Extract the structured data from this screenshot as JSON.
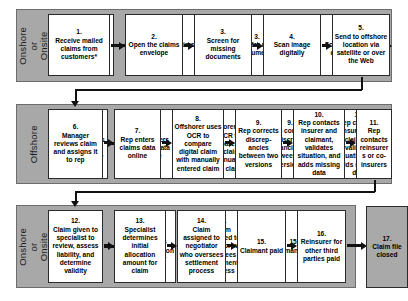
{
  "diagram": {
    "colors": {
      "band_fill": "#a8a8a8",
      "band_border": "#6d6d6d",
      "node_fill": "#ffffff",
      "node_border": "#2b2b2b",
      "node_shaded_fill": "#a9a9a9",
      "connector": "#111111",
      "page_background": "#ffffff"
    },
    "bands": [
      {
        "id": "band-onshore-top",
        "label": "Onshore\nor Onsite"
      },
      {
        "id": "band-offshore",
        "label": "Offshore"
      },
      {
        "id": "band-onshore-bottom",
        "label": "Onshore\nor Onsite"
      }
    ],
    "nodes": [
      {
        "num": "1.",
        "text": "Receive mailed claims from customers*"
      },
      {
        "num": "2.",
        "text": "Open the claims envelope"
      },
      {
        "num": "3.",
        "text": "Screen for missing documents"
      },
      {
        "num": "4.",
        "text": "Scan image digitally"
      },
      {
        "num": "5.",
        "text": "Send to offshore location via satellite or over the Web"
      },
      {
        "num": "6.",
        "text": "Manager reviews claim and assigns it to rep"
      },
      {
        "num": "7.",
        "text": "Rep enters claims data online"
      },
      {
        "num": "8.",
        "text": "Offshorer uses OCR to compare digital claim with manually entered claim"
      },
      {
        "num": "9.",
        "text": "Rep corrects discrep-ancies between two versions"
      },
      {
        "num": "10.",
        "text": "Rep contacts insurer and claimant, validates situation, and adds missing data"
      },
      {
        "num": "11.",
        "text": "Rep contacts reinsurers or co-insurers"
      },
      {
        "num": "12.",
        "text": "Claim given to specialist to review, assess liability, and determine validity"
      },
      {
        "num": "13.",
        "text": "Specialist determines initial allocation amount for claim"
      },
      {
        "num": "14.",
        "text": "Claim assigned to negotiator who oversees settlement process"
      },
      {
        "num": "15.",
        "text": "Claimant paid"
      },
      {
        "num": "16.",
        "text": "Reinsurer for other third parties paid"
      },
      {
        "num": "17.",
        "text": "Claim file closed"
      }
    ]
  }
}
